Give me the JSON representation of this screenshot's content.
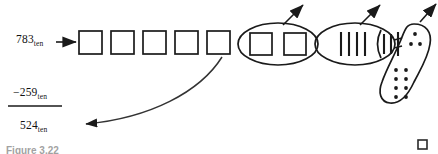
{
  "figure": {
    "caption": "Figure 3.22",
    "minuend": {
      "value": "783",
      "base": "ten"
    },
    "subtrahend": {
      "value": "−259",
      "base": "ten"
    },
    "difference": {
      "value": "524",
      "base": "ten"
    }
  },
  "colors": {
    "stroke": "#1a1a1a",
    "background": "#ffffff",
    "curve": "#333333",
    "caption": "#3a3a3a"
  },
  "diagram": {
    "plain_boxes": {
      "count": 5,
      "label": "empty square boxes row"
    },
    "ellipse_boxes": {
      "count": 2,
      "label": "ellipse grouping two boxes"
    },
    "ellipse_tallies": {
      "count": 4,
      "label": "ellipse grouping four tally marks"
    },
    "partial_tallies": {
      "count": 3,
      "label": "partial tally marks at blob edge"
    },
    "blob_dots_upper": {
      "count": 3,
      "label": "upper dot cluster in blob"
    },
    "blob_dots_lower": {
      "rows": 4,
      "cols": 2,
      "count": 8,
      "label": "lower dot grid in blob"
    },
    "arrows_up": {
      "count": 3,
      "label": "upward pointing arrows from groupings"
    },
    "arrow_in": {
      "label": "arrow into leftmost box from minuend"
    },
    "arrow_out": {
      "label": "curved arrow down to difference"
    },
    "corner_marker": {
      "label": "small square marker bottom right"
    }
  }
}
